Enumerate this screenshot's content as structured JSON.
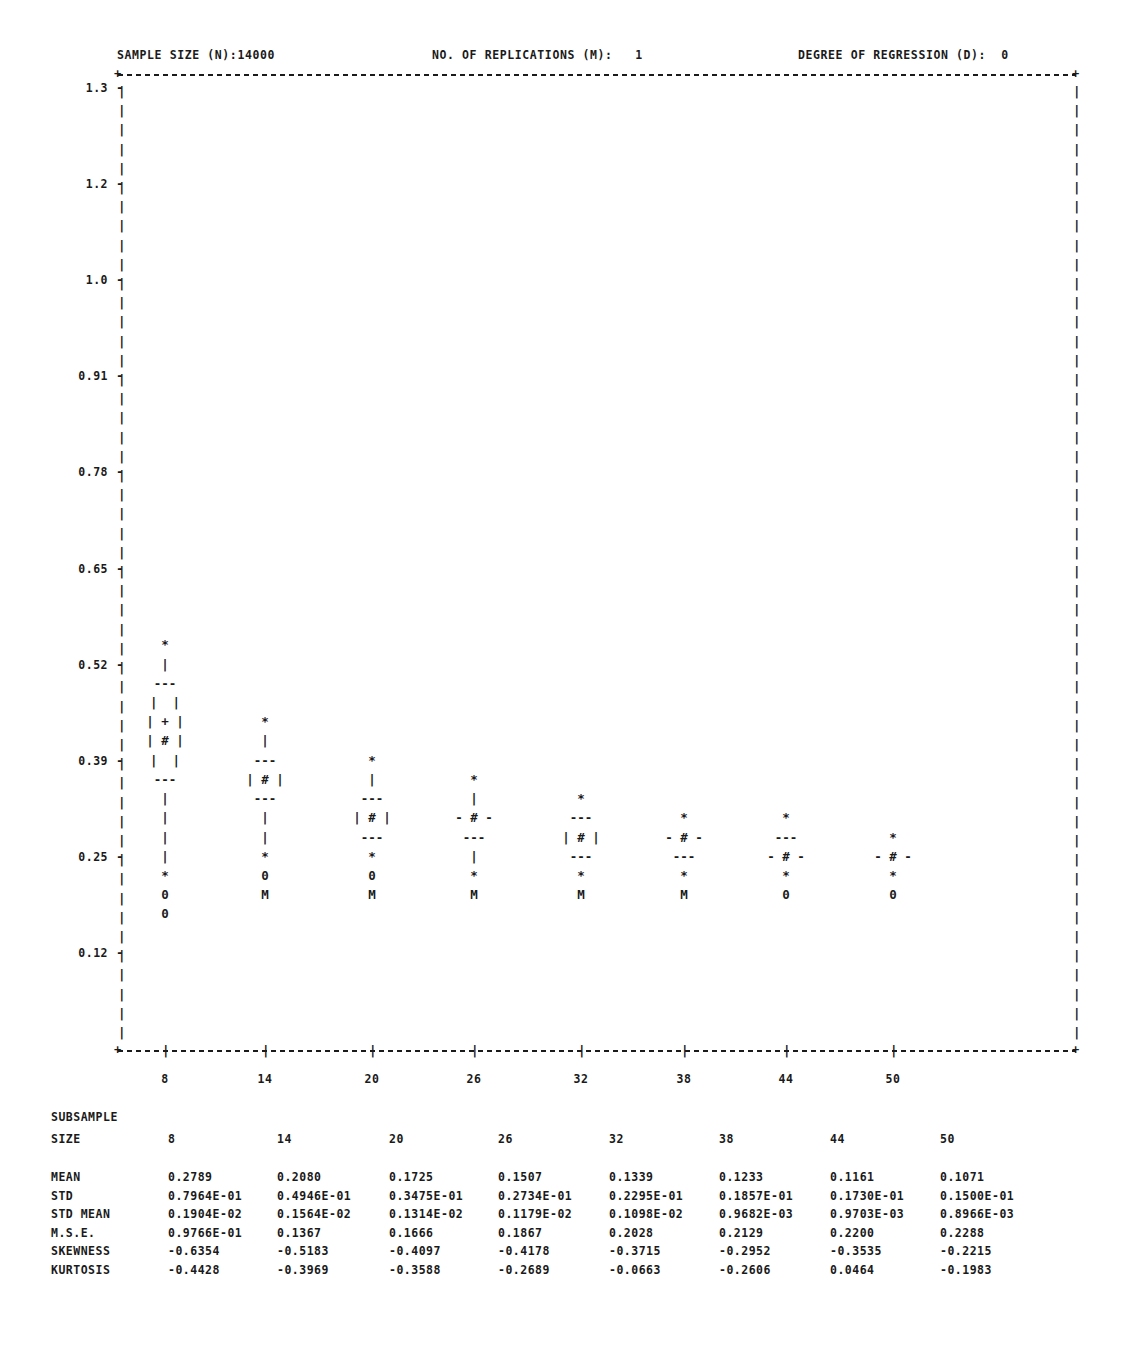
{
  "header": {
    "sample_size": "SAMPLE SIZE (N):14000",
    "replications": "NO. OF REPLICATIONS (M):   1",
    "degree": "DEGREE OF REGRESSION (D):  0"
  },
  "frame": {
    "corner_tl": "+",
    "corner_tr": "+",
    "corner_bl": "+",
    "corner_br": "+",
    "tick_dash": "-",
    "vbar": "|"
  },
  "axes": {
    "y_labels": [
      "1.3",
      "1.2",
      "1.0",
      "0.91",
      "0.78",
      "0.65",
      "0.52",
      "0.39",
      "0.25",
      "0.12"
    ],
    "y_values": [
      1.3,
      1.2,
      1.0,
      0.91,
      0.78,
      0.65,
      0.52,
      0.39,
      0.25,
      0.12
    ],
    "x_labels": [
      "8",
      "14",
      "20",
      "26",
      "32",
      "38",
      "44",
      "50"
    ]
  },
  "chart_data": {
    "type": "box",
    "title": "SAMPLE SIZE (N):14000",
    "xlabel": "SUBSAMPLE SIZE",
    "ylabel": "",
    "ylim": [
      0.0,
      1.36
    ],
    "ytick_labels": [
      "1.3",
      "1.2",
      "1.0",
      "0.91",
      "0.78",
      "0.65",
      "0.52",
      "0.39",
      "0.25",
      "0.12"
    ],
    "categories": [
      "8",
      "14",
      "20",
      "26",
      "32",
      "38",
      "44",
      "50"
    ],
    "grid": false,
    "legend": "none",
    "marker_legend": {
      "*": "extreme / whisker endpoint",
      "|": "whisker line",
      "---": "quartile (box edge)",
      "+": "box interior mark",
      "#": "median",
      "0": "low outlier marker",
      "M": "lowest marker"
    },
    "glyph_columns": [
      {
        "category": "8",
        "x_px": 165,
        "glyphs": [
          {
            "row": 29,
            "text": "*"
          },
          {
            "row": 30,
            "text": "|"
          },
          {
            "row": 31,
            "text": "---"
          },
          {
            "row": 32,
            "text": "|  |"
          },
          {
            "row": 33,
            "text": "| + |"
          },
          {
            "row": 34,
            "text": "| # |"
          },
          {
            "row": 35,
            "text": "|  |"
          },
          {
            "row": 36,
            "text": "---"
          },
          {
            "row": 37,
            "text": "|"
          },
          {
            "row": 38,
            "text": "|"
          },
          {
            "row": 39,
            "text": "|"
          },
          {
            "row": 40,
            "text": "|"
          },
          {
            "row": 41,
            "text": "*"
          },
          {
            "row": 42,
            "text": "0"
          },
          {
            "row": 43,
            "text": "0"
          }
        ]
      },
      {
        "category": "14",
        "x_px": 265,
        "glyphs": [
          {
            "row": 33,
            "text": "*"
          },
          {
            "row": 34,
            "text": "|"
          },
          {
            "row": 35,
            "text": "---"
          },
          {
            "row": 36,
            "text": "| # |"
          },
          {
            "row": 37,
            "text": "---"
          },
          {
            "row": 38,
            "text": "|"
          },
          {
            "row": 39,
            "text": "|"
          },
          {
            "row": 40,
            "text": "*"
          },
          {
            "row": 41,
            "text": "0"
          },
          {
            "row": 42,
            "text": "M"
          }
        ]
      },
      {
        "category": "20",
        "x_px": 372,
        "glyphs": [
          {
            "row": 35,
            "text": "*"
          },
          {
            "row": 36,
            "text": "|"
          },
          {
            "row": 37,
            "text": "---"
          },
          {
            "row": 38,
            "text": "| # |"
          },
          {
            "row": 39,
            "text": "---"
          },
          {
            "row": 40,
            "text": "*"
          },
          {
            "row": 41,
            "text": "0"
          },
          {
            "row": 42,
            "text": "M"
          }
        ]
      },
      {
        "category": "26",
        "x_px": 474,
        "glyphs": [
          {
            "row": 36,
            "text": "*"
          },
          {
            "row": 37,
            "text": "|"
          },
          {
            "row": 38,
            "text": "- # -"
          },
          {
            "row": 39,
            "text": "---"
          },
          {
            "row": 40,
            "text": "|"
          },
          {
            "row": 41,
            "text": "*"
          },
          {
            "row": 42,
            "text": "M"
          }
        ]
      },
      {
        "category": "32",
        "x_px": 581,
        "glyphs": [
          {
            "row": 37,
            "text": "*"
          },
          {
            "row": 38,
            "text": "---"
          },
          {
            "row": 39,
            "text": "| # |"
          },
          {
            "row": 40,
            "text": "---"
          },
          {
            "row": 41,
            "text": "*"
          },
          {
            "row": 42,
            "text": "M"
          }
        ]
      },
      {
        "category": "38",
        "x_px": 684,
        "glyphs": [
          {
            "row": 38,
            "text": "*"
          },
          {
            "row": 39,
            "text": "- # -"
          },
          {
            "row": 40,
            "text": "---"
          },
          {
            "row": 41,
            "text": "*"
          },
          {
            "row": 42,
            "text": "M"
          }
        ]
      },
      {
        "category": "44",
        "x_px": 786,
        "glyphs": [
          {
            "row": 38,
            "text": "*"
          },
          {
            "row": 39,
            "text": "---"
          },
          {
            "row": 40,
            "text": "- # -"
          },
          {
            "row": 41,
            "text": "*"
          },
          {
            "row": 42,
            "text": "0"
          }
        ]
      },
      {
        "category": "50",
        "x_px": 893,
        "glyphs": [
          {
            "row": 39,
            "text": "*"
          },
          {
            "row": 40,
            "text": "- # -"
          },
          {
            "row": 41,
            "text": "*"
          },
          {
            "row": 42,
            "text": "0"
          }
        ]
      }
    ]
  },
  "stats_table": {
    "title_line1": "SUBSAMPLE",
    "title_line2": "SIZE",
    "sizes": [
      "8",
      "14",
      "20",
      "26",
      "32",
      "38",
      "44",
      "50"
    ],
    "rows": [
      {
        "label": "MEAN",
        "values": [
          "0.2789",
          "0.2080",
          "0.1725",
          "0.1507",
          "0.1339",
          "0.1233",
          "0.1161",
          "0.1071"
        ]
      },
      {
        "label": "STD",
        "values": [
          "0.7964E-01",
          "0.4946E-01",
          "0.3475E-01",
          "0.2734E-01",
          "0.2295E-01",
          "0.1857E-01",
          "0.1730E-01",
          "0.1500E-01"
        ]
      },
      {
        "label": "STD MEAN",
        "values": [
          "0.1904E-02",
          "0.1564E-02",
          "0.1314E-02",
          "0.1179E-02",
          "0.1098E-02",
          "0.9682E-03",
          "0.9703E-03",
          "0.8966E-03"
        ]
      },
      {
        "label": "M.S.E.",
        "values": [
          "0.9766E-01",
          "0.1367",
          "0.1666",
          "0.1867",
          "0.2028",
          "0.2129",
          "0.2200",
          "0.2288"
        ]
      },
      {
        "label": "SKEWNESS",
        "values": [
          "-0.6354",
          "-0.5183",
          "-0.4097",
          "-0.4178",
          "-0.3715",
          "-0.2952",
          "-0.3535",
          "-0.2215"
        ]
      },
      {
        "label": "KURTOSIS",
        "values": [
          "-0.4428",
          "-0.3969",
          "-0.3588",
          "-0.2689",
          "-0.0663",
          "-0.2606",
          "0.0464",
          "-0.1983"
        ]
      }
    ]
  }
}
